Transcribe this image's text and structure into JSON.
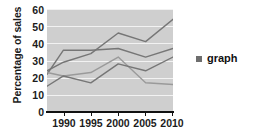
{
  "chart_data": {
    "type": "line",
    "title": "",
    "xlabel": "",
    "ylabel": "Percentage of sales",
    "ylim": [
      0,
      60
    ],
    "yticks": [
      0,
      10,
      20,
      30,
      40,
      50,
      60
    ],
    "xlim": [
      1987,
      2010
    ],
    "xticks": [
      1990,
      1995,
      2000,
      2005,
      2010
    ],
    "x": [
      1987,
      1990,
      1995,
      2000,
      2005,
      2010
    ],
    "grid": true,
    "legend_position": "right",
    "legend_entries": [
      "graph"
    ],
    "series": [
      {
        "name": "series-1",
        "values": [
          24,
          29,
          34,
          46,
          41,
          54
        ],
        "color": "#767676"
      },
      {
        "name": "series-2",
        "values": [
          22,
          36,
          36,
          37,
          32,
          37
        ],
        "color": "#767676"
      },
      {
        "name": "series-3",
        "values": [
          23,
          21,
          23,
          32,
          17,
          16
        ],
        "color": "#9a9a9a"
      },
      {
        "name": "series-4",
        "values": [
          15,
          21,
          17,
          28,
          24,
          32
        ],
        "color": "#767676"
      }
    ]
  },
  "axis": {
    "y_title": "Percentage of sales",
    "y_tick_labels": [
      "60",
      "50",
      "40",
      "30",
      "20",
      "10",
      "0"
    ],
    "x_tick_labels": [
      "1990",
      "1995",
      "2000",
      "2005",
      "2010"
    ]
  },
  "legend": {
    "marker": "square-swatch",
    "label": "graph"
  },
  "colors": {
    "plot_background": "#cfcfcf",
    "gridline": "#f2f2f2",
    "axis": "#111111",
    "line": "#767676",
    "text": "#1c1c1c"
  }
}
